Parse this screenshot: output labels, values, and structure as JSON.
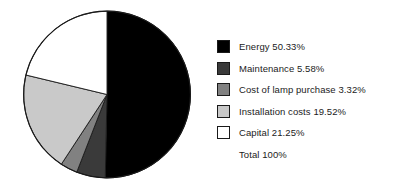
{
  "chart_data": {
    "type": "pie",
    "title": "",
    "subtitle": "",
    "xlabel": "",
    "ylabel": "",
    "legend_position": "right",
    "grid": false,
    "start_angle_deg": 0,
    "direction": "clockwise",
    "units": "percent",
    "categories": [
      "Energy",
      "Maintenance",
      "Cost of lamp purchase",
      "Installation costs",
      "Capital"
    ],
    "values": [
      50.33,
      5.58,
      3.32,
      19.52,
      21.25
    ],
    "colors": [
      "#000000",
      "#3a3a3a",
      "#818181",
      "#c9c9c9",
      "#ffffff"
    ],
    "total": 100,
    "slices": [
      {
        "label": "Energy",
        "value": 50.33,
        "color": "#000000"
      },
      {
        "label": "Maintenance",
        "value": 5.58,
        "color": "#3a3a3a"
      },
      {
        "label": "Cost of lamp purchase",
        "value": 3.32,
        "color": "#818181"
      },
      {
        "label": "Installation costs",
        "value": 19.52,
        "color": "#c9c9c9"
      },
      {
        "label": "Capital",
        "value": 21.25,
        "color": "#ffffff"
      }
    ]
  },
  "legend": {
    "entries": [
      {
        "text": "Energy 50.33%",
        "swatch": "#000000",
        "has_swatch": true
      },
      {
        "text": "Maintenance 5.58%",
        "swatch": "#3a3a3a",
        "has_swatch": true
      },
      {
        "text": "Cost of lamp purchase 3.32%",
        "swatch": "#818181",
        "has_swatch": true
      },
      {
        "text": "Installation costs 19.52%",
        "swatch": "#c9c9c9",
        "has_swatch": true
      },
      {
        "text": "Capital 21.25%",
        "swatch": "#ffffff",
        "has_swatch": true
      },
      {
        "text": "Total 100%",
        "swatch": null,
        "has_swatch": false
      }
    ]
  },
  "style": {
    "background": "#ffffff",
    "outline": "#1a1a1a",
    "text": "#1b1b1b"
  }
}
